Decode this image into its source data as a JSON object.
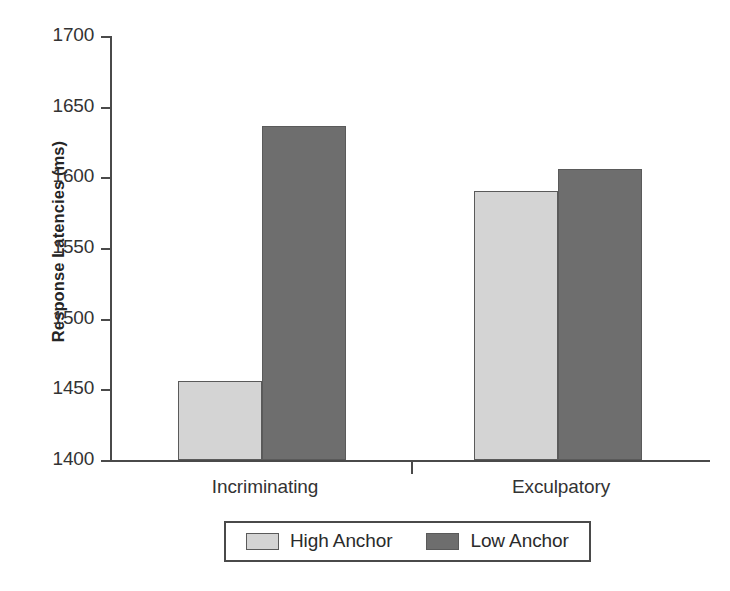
{
  "figure": {
    "scan_artifact_text": "",
    "background_color": "#ffffff"
  },
  "axes": {
    "y_title": "Response Latencies (ms)",
    "y_ticks": [
      "1700",
      "1650",
      "1600",
      "1550",
      "1500",
      "1450",
      "1400"
    ],
    "x_categories": [
      "Incriminating",
      "Exculpatory"
    ]
  },
  "legend": {
    "entries": [
      {
        "label": "High Anchor",
        "color": "#d4d4d4"
      },
      {
        "label": "Low Anchor",
        "color": "#6e6e6e"
      }
    ]
  },
  "chart_data": {
    "type": "bar",
    "title": "",
    "subtitle": "",
    "xlabel": "",
    "ylabel": "Response Latencies (ms)",
    "categories": [
      "Incriminating",
      "Exculpatory"
    ],
    "series": [
      {
        "name": "High Anchor",
        "color": "#d4d4d4",
        "values": [
          1456,
          1590
        ]
      },
      {
        "name": "Low Anchor",
        "color": "#6e6e6e",
        "values": [
          1636,
          1606
        ]
      }
    ],
    "ylim": [
      1400,
      1700
    ],
    "ytick_values": [
      1400,
      1450,
      1500,
      1550,
      1600,
      1650,
      1700
    ],
    "grid": false,
    "legend_position": "bottom",
    "units": "ms",
    "annotations": []
  }
}
